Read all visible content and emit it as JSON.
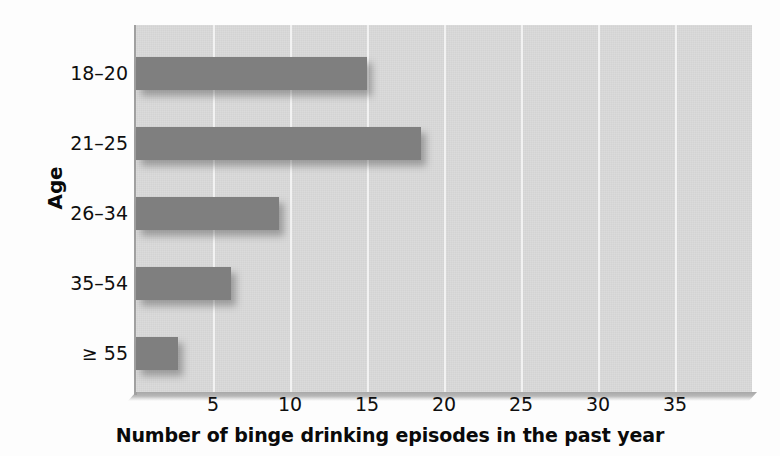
{
  "chart_data": {
    "type": "bar",
    "orientation": "horizontal",
    "title": "",
    "xlabel": "Number of binge drinking episodes in the past year",
    "ylabel": "Age",
    "categories": [
      "18–20",
      "21–25",
      "26–34",
      "35–54",
      "≥ 55"
    ],
    "values": [
      15.0,
      18.5,
      9.3,
      6.2,
      2.7
    ],
    "xlim": [
      0,
      40
    ],
    "xticks": [
      5,
      10,
      15,
      20,
      25,
      30,
      35
    ],
    "xtick_labels": [
      "5",
      "10",
      "15",
      "20",
      "25",
      "30",
      "35"
    ],
    "grid": "vertical",
    "legend": "none",
    "colors": {
      "bar": "#7f7f7f",
      "plot_background": "#d3d3d3",
      "gridline": "#f2f2f2",
      "axis": "#a0a0a0",
      "text": "#0f0f0f",
      "page_background": "#fdfdfd"
    }
  },
  "axes": {
    "y_title": "Age",
    "x_title": "Number of binge drinking episodes in the past year"
  }
}
